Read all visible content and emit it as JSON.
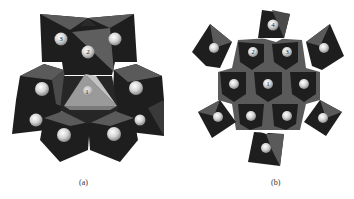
{
  "figure": {
    "panels": [
      {
        "id": "a",
        "caption": "(a)",
        "labels": {
          "l1": "1",
          "l2": "2",
          "l3": "3"
        }
      },
      {
        "id": "b",
        "caption": "(b)",
        "labels": {
          "l1": "1",
          "l2": "2",
          "l3": "3",
          "l4": "4"
        }
      }
    ],
    "colors": {
      "dark_face": "#1e1e1e",
      "mid_face": "#5a5a5a",
      "light_face": "#a8a8a8",
      "sphere": "#d8d8d8",
      "background": "#ffffff"
    }
  }
}
